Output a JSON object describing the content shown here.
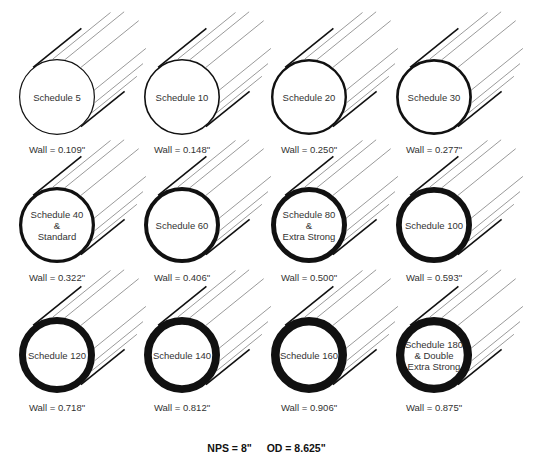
{
  "pipes": [
    {
      "label_lines": [
        "Schedule 5"
      ],
      "wall": "Wall = 0.109\"",
      "thickness": 1.2
    },
    {
      "label_lines": [
        "Schedule 10"
      ],
      "wall": "Wall = 0.148\"",
      "thickness": 1.6
    },
    {
      "label_lines": [
        "Schedule 20"
      ],
      "wall": "Wall = 0.250\"",
      "thickness": 2.4
    },
    {
      "label_lines": [
        "Schedule 30"
      ],
      "wall": "Wall = 0.277\"",
      "thickness": 2.7
    },
    {
      "label_lines": [
        "Schedule 40",
        "&",
        "Standard"
      ],
      "wall": "Wall = 0.322\"",
      "thickness": 3.2
    },
    {
      "label_lines": [
        "Schedule 60"
      ],
      "wall": "Wall = 0.406\"",
      "thickness": 4.0
    },
    {
      "label_lines": [
        "Schedule 80",
        "&",
        "Extra Strong"
      ],
      "wall": "Wall = 0.500\"",
      "thickness": 5.0
    },
    {
      "label_lines": [
        "Schedule 100"
      ],
      "wall": "Wall = 0.593\"",
      "thickness": 5.8
    },
    {
      "label_lines": [
        "Schedule 120"
      ],
      "wall": "Wall = 0.718\"",
      "thickness": 7.0
    },
    {
      "label_lines": [
        "Schedule 140"
      ],
      "wall": "Wall = 0.812\"",
      "thickness": 7.8
    },
    {
      "label_lines": [
        "Schedule 160"
      ],
      "wall": "Wall = 0.906\"",
      "thickness": 8.6
    },
    {
      "label_lines": [
        "Schedule 180",
        "& Double",
        "Extra Strong"
      ],
      "wall": "Wall = 0.875\"",
      "thickness": 8.3
    }
  ],
  "footer": {
    "nps": "NPS = 8\"",
    "od": "OD = 8.625\""
  },
  "colors": {
    "stroke": "#111111",
    "hatch": "#555555",
    "background": "#ffffff"
  }
}
